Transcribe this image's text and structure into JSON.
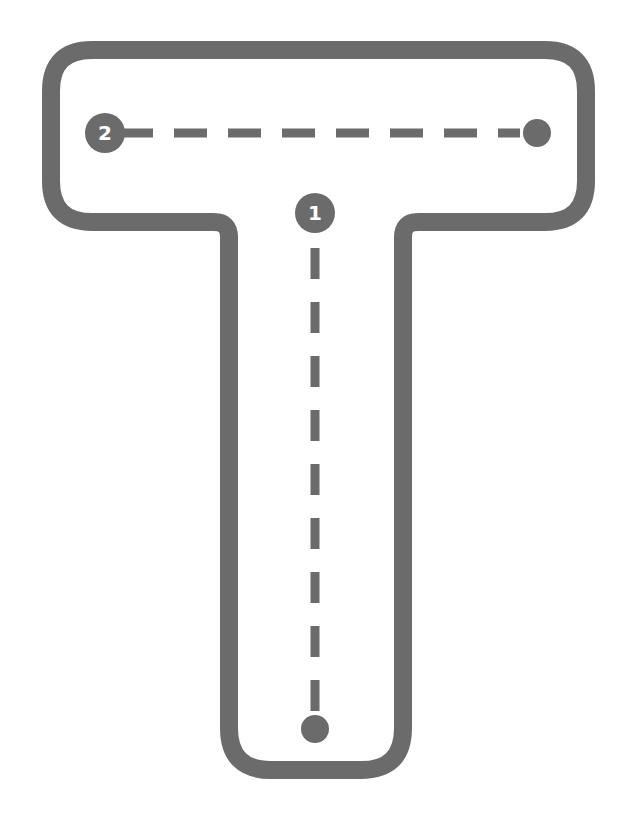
{
  "worksheet": {
    "letter": "T",
    "colors": {
      "outline": "#6b6b6b",
      "background": "#ffffff",
      "marker_text": "#ffffff"
    },
    "strokes": [
      {
        "order": "1",
        "direction": "top-to-bottom",
        "type": "vertical"
      },
      {
        "order": "2",
        "direction": "left-to-right",
        "type": "horizontal"
      }
    ]
  }
}
